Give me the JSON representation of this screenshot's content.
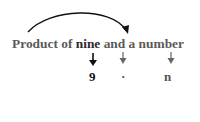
{
  "phrase": {
    "before": "Product of ",
    "highlight": "nine",
    "after": " and a number"
  },
  "translation": {
    "terms": [
      {
        "text": "9",
        "color": "#111111"
      },
      {
        "text": "·",
        "color": "#555555"
      },
      {
        "text": "n",
        "color": "#555555"
      }
    ]
  },
  "colors": {
    "phrase_text": "#5a5a5a",
    "highlight_text": "#2a2a2a",
    "primary_arrow": "#111111",
    "secondary_arrow": "#666666",
    "arc": "#111111"
  }
}
